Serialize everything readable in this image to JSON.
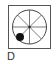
{
  "option": {
    "label": "D",
    "box": {
      "x": 8,
      "y": 5,
      "width": 43,
      "height": 44,
      "stroke": "#555555"
    },
    "circle": {
      "cx": 29.5,
      "cy": 27,
      "r": 17,
      "stroke": "#444444",
      "sectors": 8
    },
    "marker": {
      "cx": 20,
      "cy": 37,
      "r": 4,
      "fill": "#111111"
    },
    "center_dot": {
      "cx": 29.5,
      "cy": 27,
      "r": 1.2,
      "fill": "#222222"
    }
  }
}
